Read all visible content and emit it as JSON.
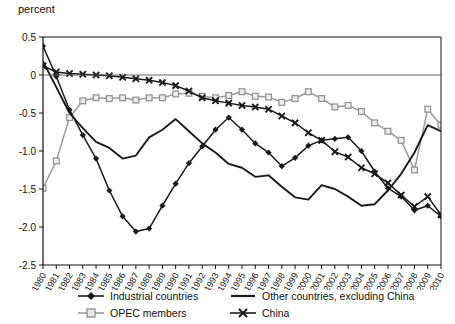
{
  "axis_title": "percent",
  "yaxis": {
    "ticks": [
      "0.5",
      "0",
      "-0.5",
      "-1.0",
      "-1.5",
      "-2.0",
      "-2.5"
    ],
    "min": -2.5,
    "max": 0.5
  },
  "legend": {
    "items": [
      {
        "label": "Industrial countries",
        "marker": "diamond-line",
        "color": "#1a1a1a"
      },
      {
        "label": "Other countries, excluding China",
        "marker": "plain-line",
        "color": "#1a1a1a"
      },
      {
        "label": "OPEC members",
        "marker": "square-line",
        "color": "#9a9a9a"
      },
      {
        "label": "China",
        "marker": "x-line",
        "color": "#1a1a1a"
      }
    ]
  },
  "chart_data": {
    "type": "line",
    "title": "",
    "xlabel": "",
    "ylabel": "percent",
    "ylim": [
      -2.5,
      0.5
    ],
    "grid": false,
    "legend_position": "bottom",
    "x": [
      1980,
      1981,
      1982,
      1983,
      1984,
      1985,
      1986,
      1987,
      1988,
      1989,
      1990,
      1991,
      1992,
      1993,
      1994,
      1995,
      1996,
      1997,
      1998,
      1999,
      2000,
      2001,
      2002,
      2003,
      2004,
      2005,
      2006,
      2007,
      2008,
      2009,
      2010
    ],
    "categories": [
      "1980",
      "1981",
      "1982",
      "1983",
      "1984",
      "1985",
      "1986",
      "1987",
      "1988",
      "1989",
      "1990",
      "1991",
      "1992",
      "1993",
      "1994",
      "1995",
      "1996",
      "1997",
      "1998",
      "1999",
      "2000",
      "2001",
      "2002",
      "2003",
      "2004",
      "2005",
      "2006",
      "2007",
      "2008",
      "2009",
      "2010"
    ],
    "series": [
      {
        "name": "Industrial countries",
        "color": "#1a1a1a",
        "marker": "diamond",
        "values": [
          0.38,
          -0.02,
          -0.46,
          -0.79,
          -1.1,
          -1.52,
          -1.86,
          -2.06,
          -2.02,
          -1.72,
          -1.43,
          -1.16,
          -0.94,
          -0.72,
          -0.56,
          -0.72,
          -0.9,
          -1.02,
          -1.2,
          -1.09,
          -0.93,
          -0.86,
          -0.84,
          -0.82,
          -1.0,
          -1.27,
          -1.49,
          -1.6,
          -1.78,
          -1.72,
          -1.86
        ]
      },
      {
        "name": "OPEC members",
        "color": "#9a9a9a",
        "marker": "square",
        "values": [
          -1.49,
          -1.13,
          -0.56,
          -0.34,
          -0.3,
          -0.31,
          -0.3,
          -0.33,
          -0.3,
          -0.3,
          -0.25,
          -0.24,
          -0.28,
          -0.3,
          -0.27,
          -0.22,
          -0.28,
          -0.29,
          -0.36,
          -0.31,
          -0.22,
          -0.31,
          -0.42,
          -0.4,
          -0.48,
          -0.63,
          -0.74,
          -0.86,
          -1.25,
          -0.45,
          -0.66
        ]
      },
      {
        "name": "Other countries, excluding China",
        "color": "#1a1a1a",
        "marker": "none",
        "values": [
          0.18,
          -0.16,
          -0.5,
          -0.7,
          -0.88,
          -0.96,
          -1.1,
          -1.06,
          -0.82,
          -0.72,
          -0.58,
          -0.74,
          -0.9,
          -1.02,
          -1.17,
          -1.22,
          -1.34,
          -1.32,
          -1.47,
          -1.61,
          -1.64,
          -1.45,
          -1.5,
          -1.6,
          -1.72,
          -1.7,
          -1.52,
          -1.3,
          -1.02,
          -0.66,
          -0.74
        ]
      },
      {
        "name": "China",
        "color": "#1a1a1a",
        "marker": "x",
        "values": [
          0.12,
          0.04,
          0.02,
          0.01,
          0.0,
          -0.01,
          -0.03,
          -0.05,
          -0.07,
          -0.1,
          -0.14,
          -0.21,
          -0.3,
          -0.34,
          -0.37,
          -0.4,
          -0.42,
          -0.45,
          -0.54,
          -0.63,
          -0.76,
          -0.86,
          -1.01,
          -1.08,
          -1.22,
          -1.3,
          -1.42,
          -1.58,
          -1.73,
          -1.6,
          -1.84
        ]
      }
    ]
  }
}
